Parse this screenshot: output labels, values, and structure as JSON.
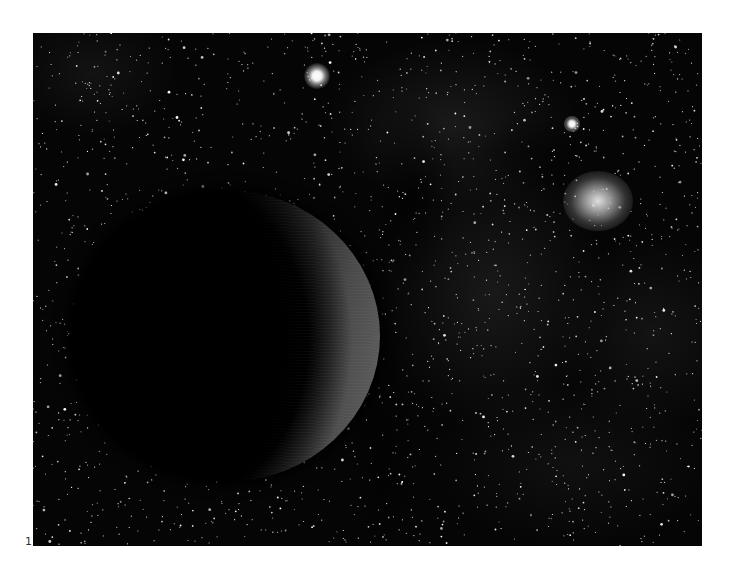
{
  "figure": {
    "panel_label": "1",
    "colors": {
      "background": "#050505",
      "page": "#ffffff",
      "planet_dark": "#000000",
      "planet_lit": "#5c5c5c",
      "star": "#ffffff"
    },
    "objects": [
      {
        "name": "planet",
        "type": "planet",
        "x": 192,
        "y": 336,
        "width": 310,
        "height": 292,
        "lit_side": "right"
      },
      {
        "name": "bright-star",
        "type": "star",
        "x": 317,
        "y": 76
      },
      {
        "name": "small-star",
        "type": "star",
        "x": 572,
        "y": 124
      },
      {
        "name": "glowing-cluster",
        "type": "cluster",
        "x": 598,
        "y": 201
      }
    ],
    "starfield": {
      "count": 2200,
      "seed": 7
    }
  }
}
